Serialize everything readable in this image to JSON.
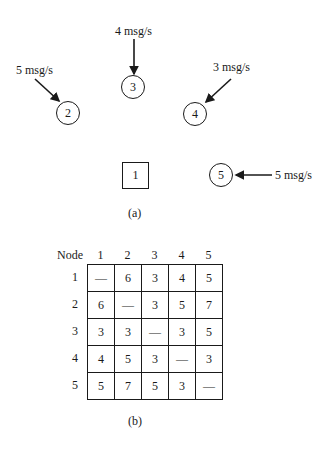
{
  "figure_a": {
    "caption": "(a)",
    "nodes": [
      {
        "id": "1",
        "shape": "square"
      },
      {
        "id": "2",
        "shape": "circle",
        "input_rate": "5 msg/s"
      },
      {
        "id": "3",
        "shape": "circle",
        "input_rate": "4 msg/s"
      },
      {
        "id": "4",
        "shape": "circle",
        "input_rate": "3 msg/s"
      },
      {
        "id": "5",
        "shape": "circle",
        "input_rate": "5 msg/s"
      }
    ]
  },
  "figure_b": {
    "caption": "(b)",
    "header_label": "Node",
    "columns": [
      "1",
      "2",
      "3",
      "4",
      "5"
    ],
    "rows": [
      {
        "label": "1",
        "cells": [
          "—",
          "6",
          "3",
          "4",
          "5"
        ]
      },
      {
        "label": "2",
        "cells": [
          "6",
          "—",
          "3",
          "5",
          "7"
        ]
      },
      {
        "label": "3",
        "cells": [
          "3",
          "3",
          "—",
          "3",
          "5"
        ]
      },
      {
        "label": "4",
        "cells": [
          "4",
          "5",
          "3",
          "—",
          "3"
        ]
      },
      {
        "label": "5",
        "cells": [
          "5",
          "7",
          "5",
          "3",
          "—"
        ]
      }
    ]
  }
}
